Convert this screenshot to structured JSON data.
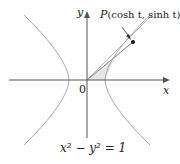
{
  "diagram": {
    "point_label_prefix": "P",
    "point_label_body": "(cosh t, sinh t)",
    "axis_x": "x",
    "axis_y": "y",
    "origin": "0",
    "equation": "x² − y² = 1",
    "colors": {
      "curve": "#a8a8a8",
      "axis": "#555555",
      "shade": "#e6e6e6",
      "point": "#111111"
    }
  }
}
